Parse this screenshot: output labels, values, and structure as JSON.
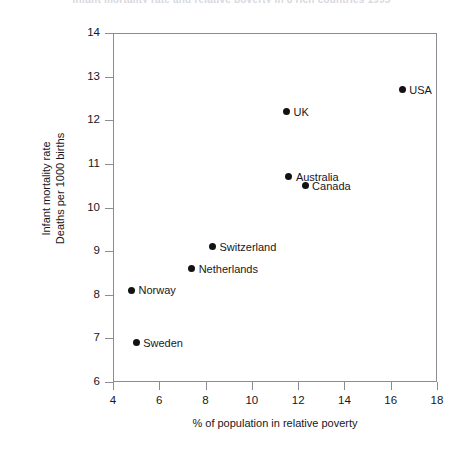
{
  "chart_data": {
    "type": "scatter",
    "title": "Infant mortality rate and relative poverty in 8 rich countries 1995",
    "xlabel": "% of population in relative poverty",
    "ylabel_line1": "Infant mortality rate",
    "ylabel_line2": "Deaths per 1000 births",
    "xlim": [
      4,
      18
    ],
    "ylim": [
      6,
      14
    ],
    "xticks": [
      4,
      6,
      8,
      10,
      12,
      14,
      16,
      18
    ],
    "yticks": [
      6,
      7,
      8,
      9,
      10,
      11,
      12,
      13,
      14
    ],
    "grid": false,
    "legend": "none",
    "marker_color": "#121212",
    "axis_color": "#8c8c94",
    "points": [
      {
        "label": "Sweden",
        "x": 5.0,
        "y": 6.9,
        "label_side": "right"
      },
      {
        "label": "Norway",
        "x": 4.8,
        "y": 8.1,
        "label_side": "right"
      },
      {
        "label": "Netherlands",
        "x": 7.4,
        "y": 8.6,
        "label_side": "right"
      },
      {
        "label": "Switzerland",
        "x": 8.3,
        "y": 9.1,
        "label_side": "right"
      },
      {
        "label": "Canada",
        "x": 12.3,
        "y": 10.5,
        "label_side": "right"
      },
      {
        "label": "Australia",
        "x": 11.6,
        "y": 10.7,
        "label_side": "right"
      },
      {
        "label": "UK",
        "x": 11.5,
        "y": 12.2,
        "label_side": "right"
      },
      {
        "label": "USA",
        "x": 16.5,
        "y": 12.7,
        "label_side": "right"
      }
    ]
  }
}
